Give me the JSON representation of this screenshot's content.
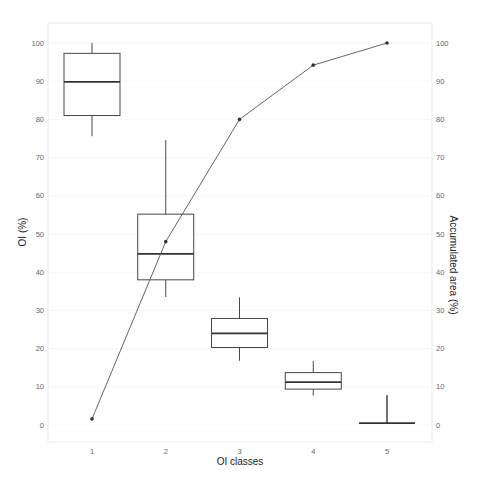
{
  "chart_data": {
    "type": "box+line",
    "title": "",
    "xlabel": "OI classes",
    "ylabel": "OI (%)",
    "ylabel_right": "Accumulated area (%)",
    "categories": [
      "1",
      "2",
      "3",
      "4",
      "5"
    ],
    "ylim": [
      -5,
      105
    ],
    "ylim_right": [
      -5,
      105
    ],
    "yticks": [
      0,
      10,
      20,
      30,
      40,
      50,
      60,
      70,
      80,
      90,
      100
    ],
    "yticks_right": [
      0,
      10,
      20,
      30,
      40,
      50,
      60,
      70,
      80,
      90,
      100
    ],
    "grid": true,
    "legend": "none",
    "boxplot_series": {
      "name": "OI (%)",
      "boxes": [
        {
          "category": "1",
          "whisker_low": 75.6,
          "q1": 81.0,
          "median": 89.8,
          "q3": 97.3,
          "whisker_high": 100.0
        },
        {
          "category": "2",
          "whisker_low": 33.5,
          "q1": 38.0,
          "median": 44.8,
          "q3": 55.2,
          "whisker_high": 74.6
        },
        {
          "category": "3",
          "whisker_low": 16.8,
          "q1": 20.3,
          "median": 24.0,
          "q3": 27.9,
          "whisker_high": 33.4
        },
        {
          "category": "4",
          "whisker_low": 7.7,
          "q1": 9.4,
          "median": 11.2,
          "q3": 13.7,
          "whisker_high": 16.8
        },
        {
          "category": "5",
          "whisker_low": 0.5,
          "q1": 0.5,
          "median": 0.5,
          "q3": 0.5,
          "whisker_high": 7.8
        }
      ]
    },
    "line_series": {
      "name": "Accumulated area (%)",
      "axis": "right",
      "values": [
        1.6,
        48.0,
        80.0,
        94.2,
        100.0
      ]
    }
  }
}
